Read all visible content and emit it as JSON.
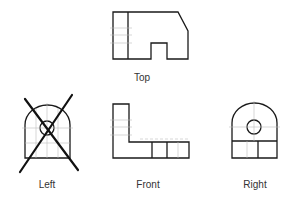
{
  "diagram": {
    "type": "orthographic-projection",
    "views": [
      {
        "id": "top",
        "label": "Top",
        "crossed_out": false
      },
      {
        "id": "left",
        "label": "Left",
        "crossed_out": true
      },
      {
        "id": "front",
        "label": "Front",
        "crossed_out": false
      },
      {
        "id": "right",
        "label": "Right",
        "crossed_out": false
      }
    ],
    "colors": {
      "outline": "#1a1a1a",
      "hidden": "#bdbdbd",
      "cross": "#111111",
      "label": "#333333",
      "background": "#ffffff"
    }
  }
}
